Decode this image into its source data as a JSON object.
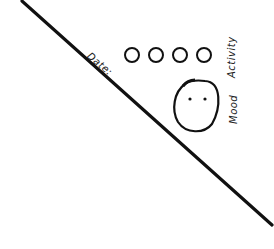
{
  "sketch": {
    "labels": {
      "date": "Date:",
      "activity": "Activity",
      "mood": "Mood"
    },
    "activity_circles": [
      {
        "name": "activity-circle-1"
      },
      {
        "name": "activity-circle-2"
      },
      {
        "name": "activity-circle-3"
      },
      {
        "name": "activity-circle-4"
      }
    ],
    "mood_face": {
      "icon": "face-icon",
      "expression": "neutral"
    },
    "colors": {
      "stroke": "#111111",
      "background": "#ffffff"
    }
  }
}
